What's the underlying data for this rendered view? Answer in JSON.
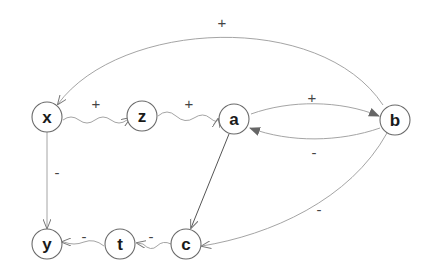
{
  "diagram": {
    "nodes": [
      {
        "id": "x",
        "label": "x"
      },
      {
        "id": "z",
        "label": "z"
      },
      {
        "id": "a",
        "label": "a"
      },
      {
        "id": "b",
        "label": "b"
      },
      {
        "id": "y",
        "label": "y"
      },
      {
        "id": "t",
        "label": "t"
      },
      {
        "id": "c",
        "label": "c"
      }
    ],
    "edges": [
      {
        "from": "b",
        "to": "x",
        "sign": "+",
        "style": "curved"
      },
      {
        "from": "x",
        "to": "z",
        "sign": "+",
        "style": "wavy"
      },
      {
        "from": "z",
        "to": "a",
        "sign": "+",
        "style": "wavy"
      },
      {
        "from": "a",
        "to": "b",
        "sign": "+",
        "style": "curved"
      },
      {
        "from": "b",
        "to": "a",
        "sign": "-",
        "style": "curved"
      },
      {
        "from": "x",
        "to": "y",
        "sign": "-",
        "style": "straight"
      },
      {
        "from": "a",
        "to": "c",
        "sign": "",
        "style": "straight"
      },
      {
        "from": "b",
        "to": "c",
        "sign": "-",
        "style": "curved"
      },
      {
        "from": "c",
        "to": "t",
        "sign": "-",
        "style": "wavy"
      },
      {
        "from": "t",
        "to": "y",
        "sign": "-",
        "style": "wavy"
      }
    ]
  }
}
